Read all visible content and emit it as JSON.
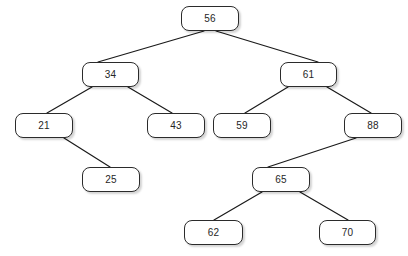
{
  "diagram": {
    "type": "binary-search-tree",
    "canvas": {
      "width": 408,
      "height": 256,
      "background": "#ffffff"
    },
    "style": {
      "node_border_color": "#2b2b2b",
      "node_fill_color": "#ffffff",
      "node_text_color": "#262626",
      "edge_color": "#1a1a1a",
      "shadow_color": "#c9c9c9"
    },
    "nodes": [
      {
        "id": "n56",
        "label": "56",
        "x": 181,
        "y": 6,
        "w": 58,
        "h": 25,
        "level": 0,
        "role": "root"
      },
      {
        "id": "n34",
        "label": "34",
        "x": 82,
        "y": 62,
        "w": 57,
        "h": 25,
        "level": 1,
        "role": "left-child"
      },
      {
        "id": "n61",
        "label": "61",
        "x": 280,
        "y": 62,
        "w": 57,
        "h": 25,
        "level": 1,
        "role": "right-child"
      },
      {
        "id": "n21",
        "label": "21",
        "x": 15,
        "y": 113,
        "w": 58,
        "h": 25,
        "level": 2,
        "role": "left-child"
      },
      {
        "id": "n43",
        "label": "43",
        "x": 147,
        "y": 113,
        "w": 58,
        "h": 25,
        "level": 2,
        "role": "right-child"
      },
      {
        "id": "n59",
        "label": "59",
        "x": 213,
        "y": 113,
        "w": 58,
        "h": 25,
        "level": 2,
        "role": "left-child"
      },
      {
        "id": "n88",
        "label": "88",
        "x": 344,
        "y": 113,
        "w": 58,
        "h": 25,
        "level": 2,
        "role": "right-child"
      },
      {
        "id": "n25",
        "label": "25",
        "x": 82,
        "y": 167,
        "w": 58,
        "h": 25,
        "level": 3,
        "role": "right-child"
      },
      {
        "id": "n65",
        "label": "65",
        "x": 252,
        "y": 167,
        "w": 58,
        "h": 25,
        "level": 3,
        "role": "left-child"
      },
      {
        "id": "n62",
        "label": "62",
        "x": 184,
        "y": 220,
        "w": 59,
        "h": 25,
        "level": 4,
        "role": "left-child"
      },
      {
        "id": "n70",
        "label": "70",
        "x": 319,
        "y": 220,
        "w": 57,
        "h": 25,
        "level": 4,
        "role": "right-child"
      }
    ],
    "edges": [
      {
        "from": "n56",
        "to": "n34",
        "x1": 204,
        "y1": 31,
        "x2": 98,
        "y2": 62
      },
      {
        "from": "n56",
        "to": "n61",
        "x1": 216,
        "y1": 31,
        "x2": 318,
        "y2": 62
      },
      {
        "from": "n34",
        "to": "n21",
        "x1": 92,
        "y1": 87,
        "x2": 47,
        "y2": 113
      },
      {
        "from": "n34",
        "to": "n43",
        "x1": 128,
        "y1": 87,
        "x2": 172,
        "y2": 113
      },
      {
        "from": "n61",
        "to": "n59",
        "x1": 288,
        "y1": 87,
        "x2": 245,
        "y2": 113
      },
      {
        "from": "n61",
        "to": "n88",
        "x1": 327,
        "y1": 87,
        "x2": 371,
        "y2": 113
      },
      {
        "from": "n21",
        "to": "n25",
        "x1": 64,
        "y1": 138,
        "x2": 110,
        "y2": 167
      },
      {
        "from": "n88",
        "to": "n65",
        "x1": 356,
        "y1": 138,
        "x2": 268,
        "y2": 167
      },
      {
        "from": "n65",
        "to": "n62",
        "x1": 262,
        "y1": 192,
        "x2": 214,
        "y2": 220
      },
      {
        "from": "n65",
        "to": "n70",
        "x1": 300,
        "y1": 192,
        "x2": 348,
        "y2": 220
      }
    ]
  }
}
